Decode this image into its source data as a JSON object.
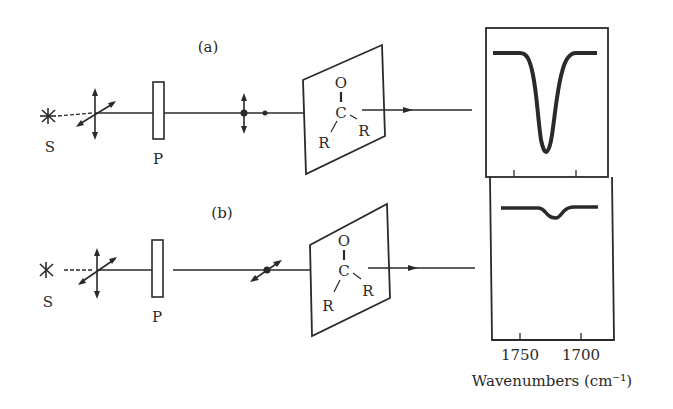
{
  "figure": {
    "panel_a": {
      "label": "(a)",
      "source_label": "S",
      "polarizer_label": "P",
      "molecule": {
        "top_atom": "O",
        "center_atom": "C",
        "left_group": "R",
        "right_group": "R"
      },
      "polarization_after_polarizer": "vertical (parallel to C=O)"
    },
    "panel_b": {
      "label": "(b)",
      "source_label": "S",
      "polarizer_label": "P",
      "molecule": {
        "top_atom": "O",
        "center_atom": "C",
        "left_group": "R",
        "right_group": "R"
      },
      "polarization_after_polarizer": "horizontal (perpendicular to C=O)"
    },
    "spectrum": {
      "x_tick_labels": [
        "1750",
        "1700"
      ],
      "x_axis_label": "Wavenumbers (cm⁻¹)",
      "top_panel": "strong absorption band",
      "bottom_panel": "weak absorption band"
    },
    "colors": {
      "ink": "#2a2a2a",
      "background": "#ffffff"
    }
  }
}
